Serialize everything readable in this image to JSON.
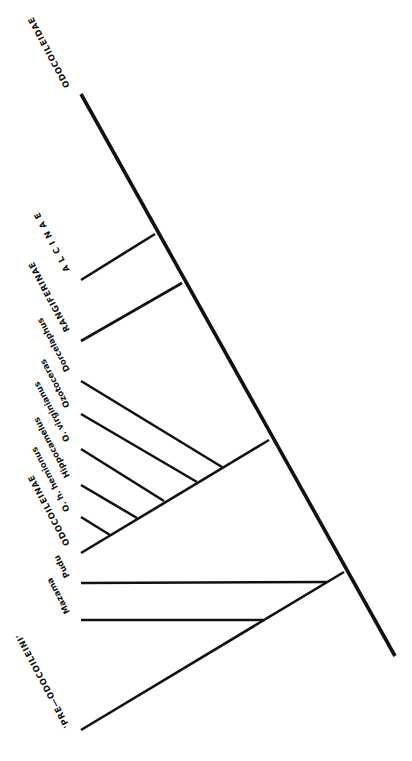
{
  "diagram": {
    "type": "cladogram",
    "orientation": "rotated (labels upside-down, tips at left)",
    "root_label": "ODOCOILEIDAE",
    "taxa": [
      {
        "id": "alcinae",
        "label": "A L C I N A E"
      },
      {
        "id": "rangiferinae",
        "label": "RANGIFERINAE"
      },
      {
        "id": "dorcelaphus",
        "label": "Dorcelaphus"
      },
      {
        "id": "ozotoceras",
        "label": "Ozotoceras"
      },
      {
        "id": "o_virginianus",
        "label": "O. virginianus"
      },
      {
        "id": "hippocamelus",
        "label": "Hippocamelus"
      },
      {
        "id": "o_h_hemionus",
        "label": "O. h. hemionus"
      },
      {
        "id": "odocoileinae",
        "label": "ODOCOILEINAE"
      },
      {
        "id": "pudu",
        "label": "Pudu"
      },
      {
        "id": "mazama",
        "label": "Mazama"
      },
      {
        "id": "pre_odocoileini",
        "label": "'PRE—ODOCOILEINI'"
      }
    ],
    "colors": {
      "line": "#111111",
      "background": "#ffffff"
    }
  }
}
